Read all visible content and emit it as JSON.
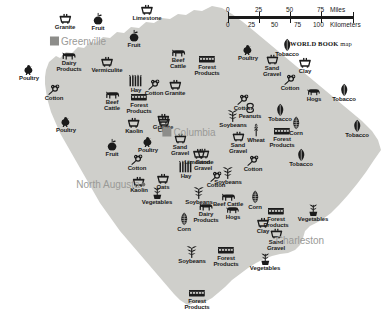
{
  "map": {
    "title": "South Carolina resource map",
    "credit_brand": "WORLD BOOK",
    "credit_suffix": " map",
    "colors": {
      "land": "#cfcfcb",
      "water": "#ffffff",
      "symbol": "#1b1b1b",
      "city_label": "#9a9a97",
      "city_marker": "#8d8d8a"
    }
  },
  "scale": {
    "miles_label": "Miles",
    "kilometers_label": "Kilometers",
    "miles_ticks": [
      "0",
      "25",
      "50",
      "75"
    ],
    "kilometers_ticks": [
      "0",
      "25",
      "50",
      "75",
      "100"
    ]
  },
  "cities": [
    {
      "name": "Greenville",
      "marker": "square",
      "x": 78,
      "y": 41,
      "label_side": "right"
    },
    {
      "name": "Columbia",
      "marker": "square",
      "x": 189,
      "y": 132,
      "label_side": "right"
    },
    {
      "name": "Charleston",
      "marker": "none",
      "x": 300,
      "y": 240,
      "label_side": "right"
    },
    {
      "name": "North\nAugusta",
      "marker": "dot",
      "x": 111,
      "y": 184,
      "label_side": "left"
    }
  ],
  "resources": [
    {
      "label": "Granite",
      "icon": "minecart-icon",
      "x": 65,
      "y": 22
    },
    {
      "label": "Fruit",
      "icon": "fruit-icon",
      "x": 98,
      "y": 22
    },
    {
      "label": "Limestone",
      "icon": "minecart-icon",
      "x": 147,
      "y": 13
    },
    {
      "label": "Fruit",
      "icon": "fruit-icon",
      "x": 134,
      "y": 39
    },
    {
      "label": "Dairy\nProducts",
      "icon": "cow-icon",
      "x": 69,
      "y": 62
    },
    {
      "label": "Vermiculite",
      "icon": "minecart-icon",
      "x": 107,
      "y": 65
    },
    {
      "label": "Beef\nCattle",
      "icon": "cow-icon",
      "x": 178,
      "y": 59
    },
    {
      "label": "Forest\nProducts",
      "icon": "logs-icon",
      "x": 207,
      "y": 66
    },
    {
      "label": "Poultry",
      "icon": "chicken-icon",
      "x": 29,
      "y": 73
    },
    {
      "label": "Poultry",
      "icon": "chicken-icon",
      "x": 248,
      "y": 53
    },
    {
      "label": "Cotton",
      "icon": "cotton-icon",
      "x": 54,
      "y": 93
    },
    {
      "label": "Hay",
      "icon": "hay-icon",
      "x": 136,
      "y": 84
    },
    {
      "label": "Cotton",
      "icon": "cotton-icon",
      "x": 154,
      "y": 88
    },
    {
      "label": "Granite",
      "icon": "minecart-icon",
      "x": 175,
      "y": 88
    },
    {
      "label": "Beef\nCattle",
      "icon": "cow-icon",
      "x": 112,
      "y": 101
    },
    {
      "label": "Forest\nProducts",
      "icon": "logs-icon",
      "x": 139,
      "y": 104
    },
    {
      "label": "Tobacco",
      "icon": "tobacco-icon",
      "x": 287,
      "y": 48
    },
    {
      "label": "Sand\nGravel",
      "icon": "minecart-icon",
      "x": 272,
      "y": 66
    },
    {
      "label": "Clay",
      "icon": "minecart-icon",
      "x": 305,
      "y": 66
    },
    {
      "label": "Cotton",
      "icon": "cotton-icon",
      "x": 290,
      "y": 83
    },
    {
      "label": "Hogs",
      "icon": "hog-icon",
      "x": 314,
      "y": 95
    },
    {
      "label": "Tobacco",
      "icon": "tobacco-icon",
      "x": 344,
      "y": 93
    },
    {
      "label": "Tobacco",
      "icon": "tobacco-icon",
      "x": 357,
      "y": 129
    },
    {
      "label": "Poultry",
      "icon": "chicken-icon",
      "x": 66,
      "y": 125
    },
    {
      "label": "Kaolin",
      "icon": "minecart-icon",
      "x": 134,
      "y": 126
    },
    {
      "label": "Clay",
      "icon": "minecart-icon",
      "x": 164,
      "y": 125
    },
    {
      "label": "Granite",
      "icon": "minecart-icon",
      "x": 163,
      "y": 122
    },
    {
      "label": "Soybeans",
      "icon": "soybean-icon",
      "x": 233,
      "y": 119
    },
    {
      "label": "Peanuts",
      "icon": "peanut-icon",
      "x": 250,
      "y": 111
    },
    {
      "label": "Cotton",
      "icon": "cotton-icon",
      "x": 243,
      "y": 103
    },
    {
      "label": "Tobacco",
      "icon": "tobacco-icon",
      "x": 280,
      "y": 113
    },
    {
      "label": "Wheat",
      "icon": "wheat-icon",
      "x": 256,
      "y": 133
    },
    {
      "label": "Corn",
      "icon": "corn-icon",
      "x": 296,
      "y": 126
    },
    {
      "label": "Forest\nProducts",
      "icon": "logs-icon",
      "x": 282,
      "y": 138
    },
    {
      "label": "Poultry",
      "icon": "chicken-icon",
      "x": 148,
      "y": 145
    },
    {
      "label": "Sand\nGravel",
      "icon": "minecart-icon",
      "x": 180,
      "y": 145
    },
    {
      "label": "Sand\nGravel",
      "icon": "minecart-icon",
      "x": 238,
      "y": 143
    },
    {
      "label": "Fruit",
      "icon": "fruit-icon",
      "x": 112,
      "y": 148
    },
    {
      "label": "Cotton",
      "icon": "cotton-icon",
      "x": 137,
      "y": 163
    },
    {
      "label": "Limestone",
      "icon": "minecart-icon",
      "x": 199,
      "y": 157
    },
    {
      "label": "Sand\nGravel",
      "icon": "minecart-icon",
      "x": 203,
      "y": 160
    },
    {
      "label": "Cotton",
      "icon": "cotton-icon",
      "x": 253,
      "y": 164
    },
    {
      "label": "Tobacco",
      "icon": "tobacco-icon",
      "x": 301,
      "y": 158
    },
    {
      "label": "Hay",
      "icon": "hay-icon",
      "x": 186,
      "y": 170
    },
    {
      "label": "Kaolin",
      "icon": "minecart-icon",
      "x": 139,
      "y": 185
    },
    {
      "label": "Oats",
      "icon": "oats-icon",
      "x": 163,
      "y": 182
    },
    {
      "label": "Soybeans",
      "icon": "soybean-icon",
      "x": 228,
      "y": 176
    },
    {
      "label": "Cotton",
      "icon": "cotton-icon",
      "x": 216,
      "y": 180
    },
    {
      "label": "Soybeans",
      "icon": "soybean-icon",
      "x": 199,
      "y": 196
    },
    {
      "label": "Vegetables",
      "icon": "vegetable-icon",
      "x": 157,
      "y": 196
    },
    {
      "label": "Beef Cattle",
      "icon": "cow-icon",
      "x": 228,
      "y": 200
    },
    {
      "label": "Corn",
      "icon": "corn-icon",
      "x": 255,
      "y": 200
    },
    {
      "label": "Dairy\nProducts",
      "icon": "cow-icon",
      "x": 206,
      "y": 213
    },
    {
      "label": "Hogs",
      "icon": "hog-icon",
      "x": 233,
      "y": 213
    },
    {
      "label": "Corn",
      "icon": "corn-icon",
      "x": 184,
      "y": 222
    },
    {
      "label": "Forest\nProducts",
      "icon": "logs-icon",
      "x": 276,
      "y": 218
    },
    {
      "label": "Vegetables",
      "icon": "vegetable-icon",
      "x": 313,
      "y": 213
    },
    {
      "label": "Clay",
      "icon": "minecart-icon",
      "x": 263,
      "y": 226
    },
    {
      "label": "Sand\nGravel",
      "icon": "minecart-icon",
      "x": 276,
      "y": 240
    },
    {
      "label": "Soybeans",
      "icon": "soybean-icon",
      "x": 192,
      "y": 255
    },
    {
      "label": "Forest\nProducts",
      "icon": "logs-icon",
      "x": 226,
      "y": 257
    },
    {
      "label": "Vegetables",
      "icon": "vegetable-icon",
      "x": 265,
      "y": 262
    },
    {
      "label": "Forest\nProducts",
      "icon": "logs-icon",
      "x": 197,
      "y": 300
    }
  ]
}
